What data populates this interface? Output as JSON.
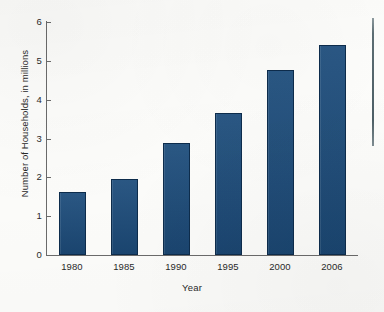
{
  "chart_data": {
    "type": "bar",
    "title": "",
    "xlabel": "Year",
    "ylabel": "Number of Households, in millions",
    "categories": [
      "1980",
      "1985",
      "1990",
      "1995",
      "2000",
      "2006"
    ],
    "values": [
      1.62,
      1.96,
      2.89,
      3.66,
      4.77,
      5.41
    ],
    "ylim": [
      0,
      6
    ],
    "yticks": [
      "0",
      "1",
      "2",
      "3",
      "4",
      "5",
      "6"
    ],
    "ytick_values": [
      0,
      1,
      2,
      3,
      4,
      5,
      6
    ],
    "grid": false,
    "legend": null,
    "series": [
      {
        "name": "Number of Households, in millions",
        "values": [
          1.62,
          1.96,
          2.89,
          3.66,
          4.77,
          5.41
        ]
      }
    ],
    "colors": {
      "bar_fill": "#1d4d7c",
      "bar_stroke": "#0d2c4c",
      "axis": "#6b6b6b",
      "text": "#2a2a2a",
      "background": "#fdfdfb",
      "artifact_line": "#5d6e74"
    },
    "annotations": [
      {
        "name": "scan-artifact-line",
        "description": "stray vertical rule at right margin"
      }
    ]
  }
}
